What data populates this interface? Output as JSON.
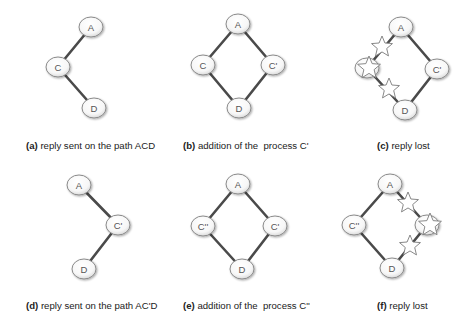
{
  "panels": [
    {
      "id": "a",
      "caption_tag": "(a)",
      "caption_text": " reply sent on the path ACD",
      "caption_pos": [
        26,
        140
      ],
      "nodes": [
        {
          "id": "A",
          "label": "A",
          "x": 91,
          "y": 27
        },
        {
          "id": "C",
          "label": "C",
          "x": 58,
          "y": 67
        },
        {
          "id": "D",
          "label": "D",
          "x": 94,
          "y": 108
        }
      ],
      "edges": [
        [
          "A",
          "C"
        ],
        [
          "C",
          "D"
        ]
      ],
      "stars": []
    },
    {
      "id": "b",
      "caption_tag": "(b)",
      "caption_text": " addition of the  process C'",
      "caption_pos": [
        183,
        140
      ],
      "nodes": [
        {
          "id": "A",
          "label": "A",
          "x": 238,
          "y": 24
        },
        {
          "id": "C",
          "label": "C",
          "x": 203,
          "y": 65
        },
        {
          "id": "Cp",
          "label": "C'",
          "x": 273,
          "y": 65
        },
        {
          "id": "D",
          "label": "D",
          "x": 239,
          "y": 108
        }
      ],
      "edges": [
        [
          "A",
          "C"
        ],
        [
          "C",
          "D"
        ],
        [
          "A",
          "Cp"
        ],
        [
          "Cp",
          "D"
        ]
      ],
      "stars": []
    },
    {
      "id": "c",
      "caption_tag": "(c)",
      "caption_text": " reply lost",
      "caption_pos": [
        377,
        140
      ],
      "nodes": [
        {
          "id": "A",
          "label": "A",
          "x": 401,
          "y": 27
        },
        {
          "id": "C",
          "label": "",
          "x": 367,
          "y": 68
        },
        {
          "id": "Cp",
          "label": "C'",
          "x": 437,
          "y": 69
        },
        {
          "id": "D",
          "label": "D",
          "x": 405,
          "y": 110
        }
      ],
      "edges": [
        [
          "A",
          "C"
        ],
        [
          "C",
          "D"
        ],
        [
          "A",
          "Cp"
        ],
        [
          "Cp",
          "D"
        ]
      ],
      "stars": [
        {
          "x": 382,
          "y": 47,
          "r": 11
        },
        {
          "x": 369,
          "y": 68,
          "r": 12
        },
        {
          "x": 389,
          "y": 89,
          "r": 11
        }
      ]
    },
    {
      "id": "d",
      "caption_tag": "(d)",
      "caption_text": " reply sent on the path AC'D",
      "caption_pos": [
        26,
        300
      ],
      "nodes": [
        {
          "id": "A",
          "label": "A",
          "x": 79,
          "y": 185
        },
        {
          "id": "Cp",
          "label": "C'",
          "x": 118,
          "y": 225
        },
        {
          "id": "D",
          "label": "D",
          "x": 84,
          "y": 269
        }
      ],
      "edges": [
        [
          "A",
          "Cp"
        ],
        [
          "Cp",
          "D"
        ]
      ],
      "stars": []
    },
    {
      "id": "e",
      "caption_tag": "(e)",
      "caption_text": " addition of the  process C''",
      "caption_pos": [
        183,
        300
      ],
      "nodes": [
        {
          "id": "A",
          "label": "A",
          "x": 238,
          "y": 184
        },
        {
          "id": "Cpp",
          "label": "C''",
          "x": 203,
          "y": 226
        },
        {
          "id": "Cp",
          "label": "C'",
          "x": 275,
          "y": 226
        },
        {
          "id": "D",
          "label": "D",
          "x": 242,
          "y": 269
        }
      ],
      "edges": [
        [
          "A",
          "Cpp"
        ],
        [
          "Cpp",
          "D"
        ],
        [
          "A",
          "Cp"
        ],
        [
          "Cp",
          "D"
        ]
      ],
      "stars": []
    },
    {
      "id": "f",
      "caption_tag": "(f)",
      "caption_text": " reply lost",
      "caption_pos": [
        377,
        300
      ],
      "nodes": [
        {
          "id": "A",
          "label": "A",
          "x": 390,
          "y": 184
        },
        {
          "id": "Cpp",
          "label": "C''",
          "x": 354,
          "y": 225
        },
        {
          "id": "Cp",
          "label": "",
          "x": 427,
          "y": 225
        },
        {
          "id": "D",
          "label": "D",
          "x": 392,
          "y": 268
        }
      ],
      "edges": [
        [
          "A",
          "Cpp"
        ],
        [
          "Cpp",
          "D"
        ],
        [
          "A",
          "Cp"
        ],
        [
          "Cp",
          "D"
        ]
      ],
      "stars": [
        {
          "x": 408,
          "y": 203,
          "r": 11
        },
        {
          "x": 430,
          "y": 225,
          "r": 12
        },
        {
          "x": 410,
          "y": 246,
          "r": 11
        }
      ]
    }
  ],
  "style": {
    "node_rx": 12,
    "node_ry": 10,
    "edge_color": "#4a4a4a",
    "node_stroke": "#8a8a8a"
  }
}
